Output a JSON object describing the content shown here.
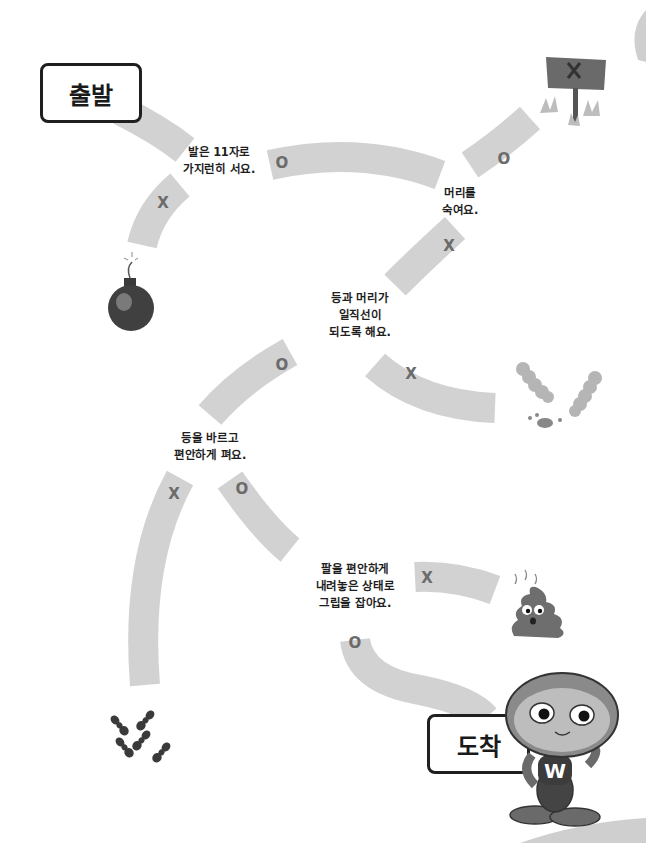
{
  "start_label": "출발",
  "finish_label": "도착",
  "colors": {
    "path": "#d2d2d2",
    "mark": "#6b6b6b",
    "text": "#1e1e1e",
    "background": "#ffffff"
  },
  "checkpoints": [
    {
      "id": "feet",
      "lines": [
        "발은 11자로",
        "가지런히 서요."
      ]
    },
    {
      "id": "head",
      "lines": [
        "머리를",
        "숙여요."
      ]
    },
    {
      "id": "back_head",
      "lines": [
        "등과 머리가",
        "일직선이",
        "되도록 해요."
      ]
    },
    {
      "id": "back",
      "lines": [
        "등을 바르고",
        "편안하게 펴요."
      ]
    },
    {
      "id": "arms",
      "lines": [
        "팔을 편안하게",
        "내려놓은 상태로",
        "그립을 잡아요."
      ]
    }
  ],
  "marks": {
    "feet_o": "O",
    "feet_x": "X",
    "head_o": "O",
    "head_x": "X",
    "backhead_o": "O",
    "backhead_x": "X",
    "back_o": "O",
    "back_x": "X",
    "arms_o": "O",
    "arms_x": "X"
  },
  "dead_ends": [
    {
      "name": "bomb"
    },
    {
      "name": "x-signpost"
    },
    {
      "name": "caterpillars"
    },
    {
      "name": "poop"
    },
    {
      "name": "ants"
    }
  ],
  "mascot": {
    "shirt_letter": "W"
  }
}
